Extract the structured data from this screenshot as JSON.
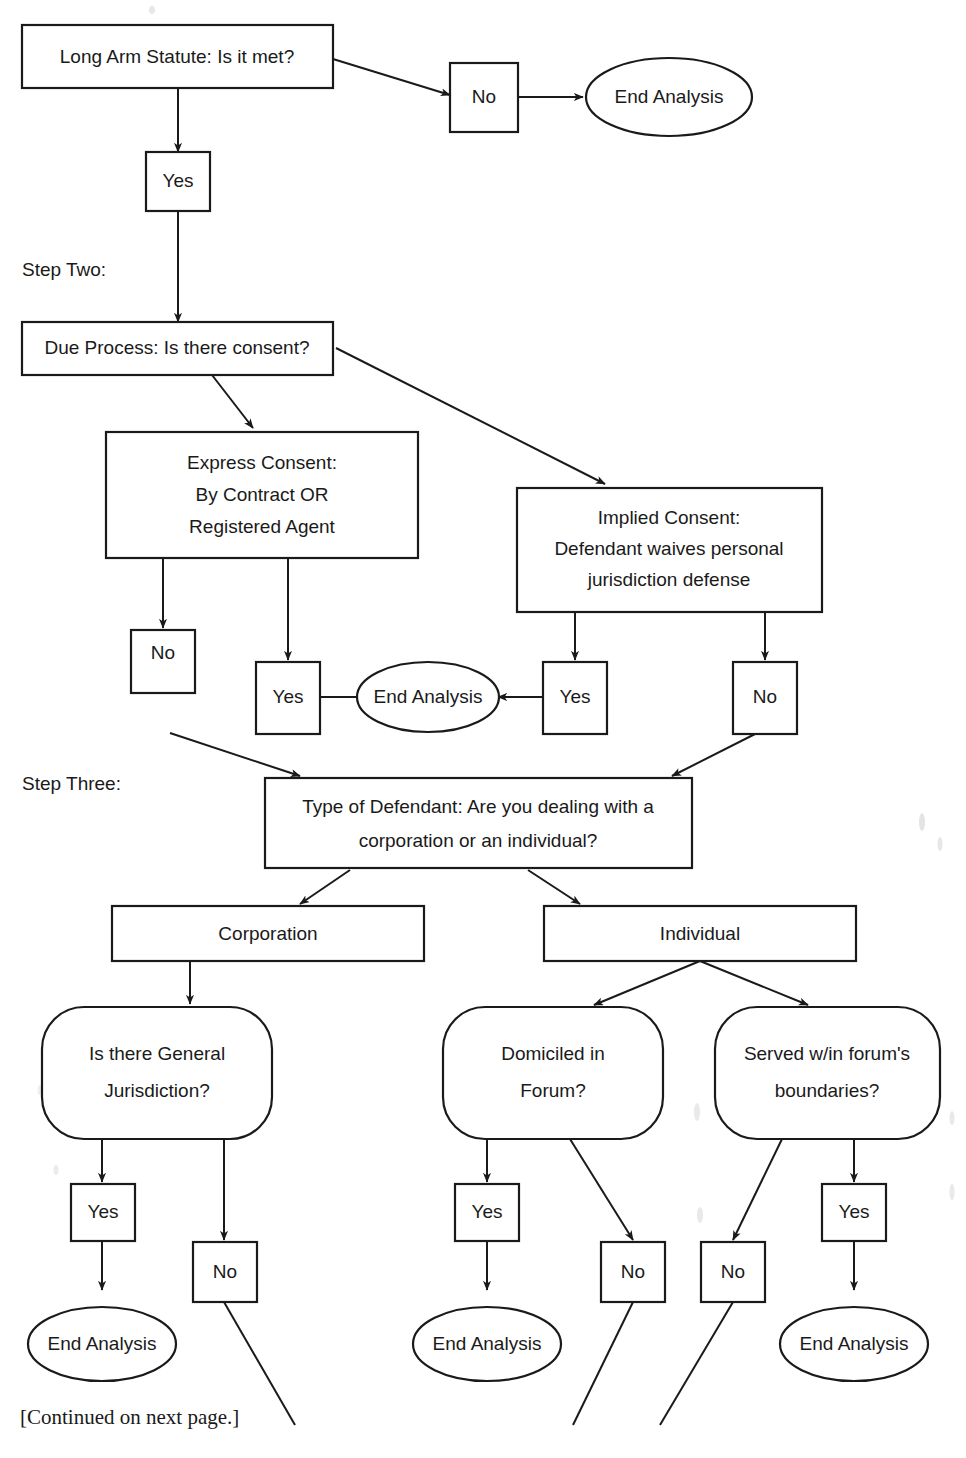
{
  "document": {
    "type": "flowchart",
    "title": "Personal Jurisdiction Analysis Flowchart",
    "footnote": "[Continued on next page.]"
  },
  "step_labels": {
    "step_two": "Step Two:",
    "step_three": "Step Three:"
  },
  "nodes": {
    "long_arm": "Long Arm Statute: Is it met?",
    "long_arm_no": "No",
    "long_arm_end": "End Analysis",
    "long_arm_yes": "Yes",
    "due_process": "Due Process: Is there consent?",
    "express_consent_line1": "Express Consent:",
    "express_consent_line2": "By Contract OR",
    "express_consent_line3": "Registered Agent",
    "implied_consent_line1": "Implied Consent:",
    "implied_consent_line2": "Defendant waives personal",
    "implied_consent_line3": "jurisdiction defense",
    "express_no": "No",
    "express_yes": "Yes",
    "consent_end": "End Analysis",
    "implied_yes": "Yes",
    "implied_no": "No",
    "type_defendant_line1": "Type of Defendant:  Are you dealing with a",
    "type_defendant_line2": "corporation or an individual?",
    "corporation": "Corporation",
    "individual": "Individual",
    "general_jurisdiction_line1": "Is there General",
    "general_jurisdiction_line2": "Jurisdiction?",
    "domiciled_line1": "Domiciled in",
    "domiciled_line2": "Forum?",
    "served_line1": "Served w/in forum's",
    "served_line2": "boundaries?",
    "gj_yes": "Yes",
    "gj_no": "No",
    "gj_end": "End Analysis",
    "dom_yes": "Yes",
    "dom_no": "No",
    "dom_end": "End Analysis",
    "served_no": "No",
    "served_yes": "Yes",
    "served_end": "End Analysis"
  },
  "colors": {
    "ink": "#1a1a1a",
    "paper": "#ffffff"
  }
}
